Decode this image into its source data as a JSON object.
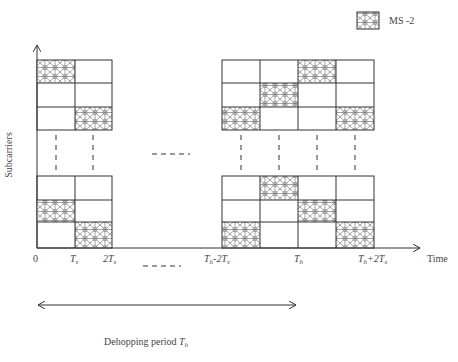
{
  "legend": {
    "label": "MS -2",
    "pattern": "hatched-mesh"
  },
  "axes": {
    "y_label": "Subcarriers",
    "x_label": "Time",
    "x_ticks": [
      "0",
      "T_s",
      "2T_s",
      "T_h-2T_s",
      "T_h",
      "T_h+2T_s"
    ]
  },
  "ticks": {
    "t0": "0",
    "ts": "T",
    "ts_sub": "s",
    "two_ts": "2T",
    "two_ts_sub": "s",
    "th_minus": "T",
    "th_minus_sub": "h",
    "th_minus_tail": "-2T",
    "th_minus_tail_sub": "s",
    "th": "T",
    "th_sub": "h",
    "th_plus": "T",
    "th_plus_sub": "h",
    "th_plus_tail": "+2T",
    "th_plus_tail_sub": "s"
  },
  "period": {
    "label": "Dehopping period ",
    "symbol": "T",
    "symbol_sub": "h"
  },
  "grids": {
    "left_top": {
      "cols": 2,
      "rows": 3,
      "filled": [
        [
          0,
          0
        ],
        [
          2,
          1
        ]
      ]
    },
    "left_bottom": {
      "cols": 2,
      "rows": 3,
      "filled": [
        [
          1,
          0
        ],
        [
          2,
          1
        ]
      ]
    },
    "right_top": {
      "cols": 4,
      "rows": 3,
      "filled": [
        [
          0,
          2
        ],
        [
          1,
          1
        ],
        [
          2,
          0
        ],
        [
          2,
          3
        ]
      ]
    },
    "right_bottom": {
      "cols": 4,
      "rows": 3,
      "filled": [
        [
          0,
          1
        ],
        [
          1,
          2
        ],
        [
          2,
          0
        ],
        [
          2,
          3
        ]
      ]
    }
  },
  "colors": {
    "line": "#333333",
    "hatch": "#555555",
    "background": "#ffffff"
  }
}
